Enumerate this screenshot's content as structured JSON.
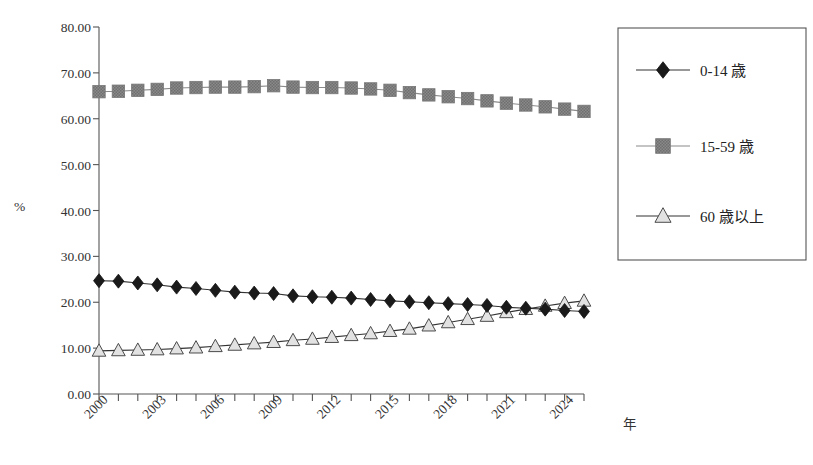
{
  "chart_data": {
    "type": "line",
    "title": "",
    "xlabel": "年",
    "ylabel": "%",
    "ylim": [
      0,
      80
    ],
    "ytick_labels": [
      "0.00",
      "10.00",
      "20.00",
      "30.00",
      "40.00",
      "50.00",
      "60.00",
      "70.00",
      "80.00"
    ],
    "ytick_values": [
      0,
      10,
      20,
      30,
      40,
      50,
      60,
      70,
      80
    ],
    "grid": false,
    "legend_position": "right",
    "x": [
      2000,
      2001,
      2002,
      2003,
      2004,
      2005,
      2006,
      2007,
      2008,
      2009,
      2010,
      2011,
      2012,
      2013,
      2014,
      2015,
      2016,
      2017,
      2018,
      2019,
      2020,
      2021,
      2022,
      2023,
      2024,
      2025
    ],
    "xtick_labels": [
      "2000",
      "2003",
      "2006",
      "2009",
      "2012",
      "2015",
      "2018",
      "2021",
      "2024"
    ],
    "xtick_values": [
      2000,
      2003,
      2006,
      2009,
      2012,
      2015,
      2018,
      2021,
      2024
    ],
    "series": [
      {
        "name": "0-14 歳",
        "marker": "diamond",
        "color": "#1a1a1a",
        "values": [
          24.7,
          24.6,
          24.2,
          23.8,
          23.3,
          23.0,
          22.6,
          22.2,
          22.0,
          21.9,
          21.4,
          21.2,
          21.1,
          20.9,
          20.6,
          20.3,
          20.1,
          19.9,
          19.7,
          19.5,
          19.3,
          18.9,
          18.7,
          18.5,
          18.2,
          18.0
        ]
      },
      {
        "name": "15-59 歳",
        "marker": "square",
        "color": "#808080",
        "values": [
          65.9,
          66.0,
          66.2,
          66.4,
          66.7,
          66.8,
          66.9,
          66.9,
          67.0,
          67.2,
          66.9,
          66.8,
          66.8,
          66.7,
          66.5,
          66.2,
          65.7,
          65.2,
          64.8,
          64.4,
          63.9,
          63.4,
          63.0,
          62.6,
          62.1,
          61.6
        ]
      },
      {
        "name": "60 歳以上",
        "marker": "triangle",
        "color": "#d8d8d8",
        "values": [
          9.4,
          9.5,
          9.6,
          9.7,
          9.9,
          10.1,
          10.4,
          10.7,
          11.0,
          11.3,
          11.7,
          12.0,
          12.4,
          12.8,
          13.2,
          13.7,
          14.2,
          14.9,
          15.6,
          16.3,
          17.0,
          17.8,
          18.5,
          19.2,
          19.8,
          20.3
        ]
      }
    ]
  },
  "legend": {
    "items": [
      {
        "label": "0-14 歳",
        "marker": "diamond"
      },
      {
        "label": "15-59 歳",
        "marker": "square"
      },
      {
        "label": "60 歳以上",
        "marker": "triangle"
      }
    ]
  },
  "axes": {
    "y_axis_title": "%",
    "x_axis_title": "年"
  }
}
